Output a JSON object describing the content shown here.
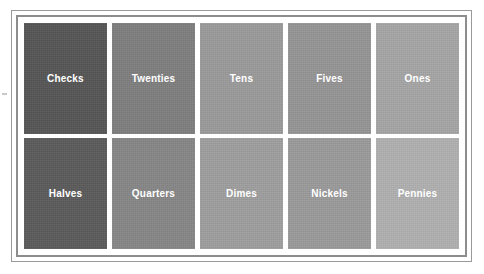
{
  "page": {
    "background_color": "#ffffff",
    "margin_mark": "·"
  },
  "frame": {
    "outer_border_color": "#9a9a9a",
    "inner_border_color": "#8d8d8d",
    "style": "double-line rectangle"
  },
  "grid": {
    "columns": 5,
    "rows": 2,
    "label_color": "#ffffff",
    "tiles": [
      {
        "label": "Checks",
        "color": "#555555",
        "row": 1,
        "col": 1
      },
      {
        "label": "Twenties",
        "color": "#7e7e7e",
        "row": 1,
        "col": 2
      },
      {
        "label": "Tens",
        "color": "#9a9a9a",
        "row": 1,
        "col": 3
      },
      {
        "label": "Fives",
        "color": "#949494",
        "row": 1,
        "col": 4
      },
      {
        "label": "Ones",
        "color": "#a5a5a5",
        "row": 1,
        "col": 5
      },
      {
        "label": "Halves",
        "color": "#5a5a5a",
        "row": 2,
        "col": 1
      },
      {
        "label": "Quarters",
        "color": "#868686",
        "row": 2,
        "col": 2
      },
      {
        "label": "Dimes",
        "color": "#9e9e9e",
        "row": 2,
        "col": 3
      },
      {
        "label": "Nickels",
        "color": "#9a9a9a",
        "row": 2,
        "col": 4
      },
      {
        "label": "Pennies",
        "color": "#b0b0b0",
        "row": 2,
        "col": 5
      }
    ]
  }
}
